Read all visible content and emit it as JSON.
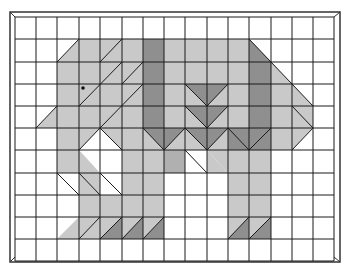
{
  "figure": {
    "grid": {
      "columns": 15,
      "rows": 11
    },
    "eye": {
      "col": 3,
      "row": 3
    }
  },
  "colors": {
    "background": "#ffffff",
    "grid_line": "#1a1a1a",
    "light": "#c9c9c9",
    "medium": "#b0b0b0",
    "dark": "#8f8f8f"
  }
}
